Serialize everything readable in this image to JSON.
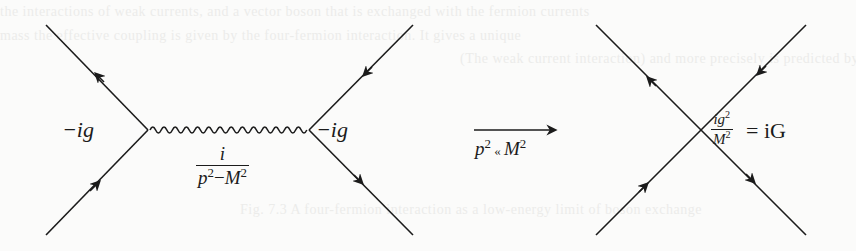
{
  "background_color": "#fbfbfa",
  "ink_color": "#1b1b1b",
  "bleed_through_lines": [
    "the interactions of weak currents, and a vector boson that is exchanged with the fermion currents",
    "mass the effective coupling is given by the four-fermion interaction. It gives a unique",
    "(The weak current interaction) and more precisely is predicted by the coupling between",
    "Fig. 7.3 A four-fermion interaction as a low-energy limit of boson exchange"
  ],
  "diagram_left": {
    "title": "boson exchange diagram",
    "vertex_left_label": "−ig",
    "vertex_right_label": "−ig",
    "propagator_numerator": "i",
    "propagator_denominator": "p²−M²",
    "propagator_denominator_parts": {
      "p": "p",
      "p_exp": "2",
      "minus": "−",
      "M": "M",
      "M_exp": "2"
    }
  },
  "limit_arrow": {
    "label": "p² ≪ M²",
    "label_parts": {
      "p": "p",
      "p_exp": "2",
      "op": " « ",
      "M": "M",
      "M_exp": "2"
    }
  },
  "diagram_right": {
    "title": "four-fermion contact interaction",
    "coupling_numerator": "ig²",
    "coupling_numerator_parts": {
      "base": "ig",
      "exp": "2"
    },
    "coupling_denominator_parts": {
      "base": "M",
      "exp": "2"
    },
    "coupling_rhs": "= iG"
  }
}
